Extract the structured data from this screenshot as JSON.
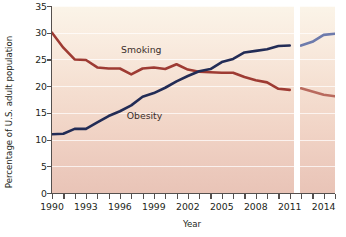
{
  "chart_data": {
    "type": "line",
    "title": "",
    "xlabel": "Year",
    "ylabel": "Percentage of U.S. adult population",
    "xlim": [
      1990,
      2015
    ],
    "ylim": [
      0,
      35
    ],
    "ytick_values": [
      0,
      5,
      10,
      15,
      20,
      25,
      30,
      35
    ],
    "ytick_labels": [
      "0",
      "5",
      "10",
      "15",
      "20",
      "25",
      "30",
      "35"
    ],
    "xtick_values": [
      1990,
      1991,
      1992,
      1993,
      1994,
      1995,
      1996,
      1997,
      1998,
      1999,
      2000,
      2001,
      2002,
      2003,
      2004,
      2005,
      2006,
      2007,
      2008,
      2009,
      2010,
      2011,
      2012,
      2013,
      2014,
      2015
    ],
    "xtick_labels": [
      "1990",
      "",
      "",
      "1993",
      "",
      "",
      "1996",
      "",
      "",
      "1999",
      "",
      "",
      "2002",
      "",
      "",
      "2005",
      "",
      "",
      "2008",
      "",
      "",
      "2011",
      "",
      "",
      "2014",
      ""
    ],
    "grid": "horizontal",
    "legend_position": "inline",
    "series_break": {
      "label": "methodology break",
      "from_year": 2011,
      "to_year": 2012
    },
    "series": [
      {
        "name": "Smoking",
        "color": "#9e3b33",
        "color_after_break": "#b96a5e",
        "label_x": 1996.1,
        "label_y": 26.7,
        "x": [
          1990,
          1991,
          1992,
          1993,
          1994,
          1995,
          1996,
          1997,
          1998,
          1999,
          2000,
          2001,
          2002,
          2003,
          2004,
          2005,
          2006,
          2007,
          2008,
          2009,
          2010,
          2011
        ],
        "values": [
          30.0,
          27.2,
          25.0,
          24.9,
          23.5,
          23.3,
          23.3,
          22.2,
          23.3,
          23.5,
          23.2,
          24.1,
          23.1,
          22.7,
          22.6,
          22.5,
          22.5,
          21.7,
          21.1,
          20.7,
          19.5,
          19.3
        ]
      },
      {
        "name": "Smoking (after break)",
        "color": "#b96a5e",
        "x": [
          2012,
          2013,
          2014,
          2015
        ],
        "values": [
          19.6,
          19.0,
          18.4,
          18.1
        ]
      },
      {
        "name": "Obesity",
        "color": "#222c56",
        "color_after_break": "#6e7bac",
        "label_x": 1996.6,
        "label_y": 14.5,
        "x": [
          1990,
          1991,
          1992,
          1993,
          1994,
          1995,
          1996,
          1997,
          1998,
          1999,
          2000,
          2001,
          2002,
          2003,
          2004,
          2005,
          2006,
          2007,
          2008,
          2009,
          2010,
          2011
        ],
        "values": [
          11.0,
          11.1,
          12.0,
          12.0,
          13.2,
          14.4,
          15.3,
          16.4,
          18.0,
          18.7,
          19.7,
          20.9,
          21.9,
          22.8,
          23.2,
          24.5,
          25.1,
          26.3,
          26.6,
          26.9,
          27.5,
          27.6
        ]
      },
      {
        "name": "Obesity (after break)",
        "color": "#6e7bac",
        "x": [
          2012,
          2013,
          2014,
          2015
        ],
        "values": [
          27.6,
          28.3,
          29.6,
          29.8
        ]
      }
    ]
  }
}
